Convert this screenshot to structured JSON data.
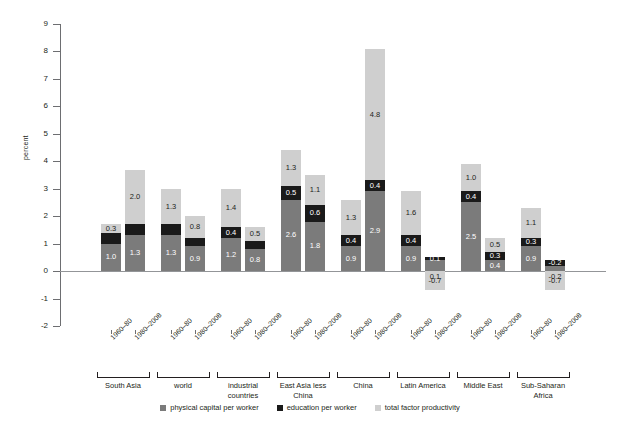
{
  "chart_data": {
    "type": "bar",
    "stacked": true,
    "title": "",
    "xlabel": "",
    "ylabel": "percent",
    "ylim": [
      -2,
      9
    ],
    "yticks": [
      9,
      8,
      7,
      6,
      5,
      4,
      3,
      2,
      1,
      0,
      -1,
      -2
    ],
    "ytick_labels": [
      "9",
      "8",
      "7",
      "6",
      "5",
      "4",
      "3",
      "2",
      "1",
      "0",
      "-1",
      "-2"
    ],
    "grid": false,
    "legend_position": "bottom",
    "series": [
      {
        "name": "physical capital  per worker",
        "color": "#7b7b7b",
        "values": [
          1.0,
          1.3,
          1.3,
          0.9,
          1.2,
          0.8,
          2.6,
          1.8,
          0.9,
          2.9,
          0.9,
          0.4,
          2.5,
          0.4,
          0.9,
          0.2
        ]
      },
      {
        "name": "education  per worker",
        "color": "#1a1a1a",
        "values": [
          0.4,
          0.4,
          0.4,
          0.3,
          0.4,
          0.3,
          0.5,
          0.6,
          0.4,
          0.4,
          0.4,
          0.1,
          0.4,
          0.3,
          0.3,
          0.2
        ]
      },
      {
        "name": "total factor productivity",
        "color": "#cfcfcf",
        "values": [
          0.3,
          2.0,
          1.3,
          0.8,
          1.4,
          0.5,
          1.3,
          1.1,
          1.3,
          4.8,
          1.6,
          -0.7,
          1.0,
          0.5,
          1.1,
          -0.7
        ]
      }
    ],
    "categories": [
      "1960–80",
      "1980–2008",
      "1960–80",
      "1980–2008",
      "1960–80",
      "1980–2008",
      "1960–80",
      "1980–2008",
      "1960–80",
      "1980–2008",
      "1960–80",
      "1980–2008",
      "1960–80",
      "1980–2008",
      "1960–80",
      "1980–2008"
    ],
    "groups": [
      {
        "name": "South Asia",
        "start": 0,
        "end": 1
      },
      {
        "name": "world",
        "start": 2,
        "end": 3
      },
      {
        "name": "industrial\ncountries",
        "start": 4,
        "end": 5
      },
      {
        "name": "East Asia less\nChina",
        "start": 6,
        "end": 7
      },
      {
        "name": "China",
        "start": 8,
        "end": 9
      },
      {
        "name": "Latin America",
        "start": 10,
        "end": 11
      },
      {
        "name": "Middle East",
        "start": 12,
        "end": 13
      },
      {
        "name": "Sub-Saharan\nAfrica",
        "start": 14,
        "end": 15
      }
    ],
    "data_labels": [
      {
        "pc": "1.0",
        "ed": "",
        "tfp": "0.3"
      },
      {
        "pc": "1.3",
        "ed": "",
        "tfp": "2.0"
      },
      {
        "pc": "1.3",
        "ed": "",
        "tfp": "1.3"
      },
      {
        "pc": "0.9",
        "ed": "",
        "tfp": "0.8"
      },
      {
        "pc": "1.2",
        "ed": "0.4",
        "tfp": "1.4"
      },
      {
        "pc": "0.8",
        "ed": "",
        "tfp": "0.5"
      },
      {
        "pc": "2.6",
        "ed": "0.5",
        "tfp": "1.3"
      },
      {
        "pc": "1.8",
        "ed": "0.6",
        "tfp": "1.1"
      },
      {
        "pc": "0.9",
        "ed": "0.4",
        "tfp": "1.3"
      },
      {
        "pc": "2.9",
        "ed": "0.4",
        "tfp": "4.8"
      },
      {
        "pc": "0.9",
        "ed": "0.4",
        "tfp": "1.6"
      },
      {
        "pc": "",
        "ed": "0.1",
        "tfp": "-0.7"
      },
      {
        "pc": "2.5",
        "ed": "0.4",
        "tfp": "1.0"
      },
      {
        "pc": "0.4",
        "ed": "0.3",
        "tfp": "0.5"
      },
      {
        "pc": "0.9",
        "ed": "0.3",
        "tfp": "1.1"
      },
      {
        "pc": "",
        "ed": "-0.2",
        "tfp": "-0.7"
      }
    ]
  },
  "legend": {
    "physical_capital": "physical capital  per worker",
    "education": "education  per worker",
    "tfp": "total factor productivity"
  },
  "axis": {
    "y_title": "percent"
  }
}
